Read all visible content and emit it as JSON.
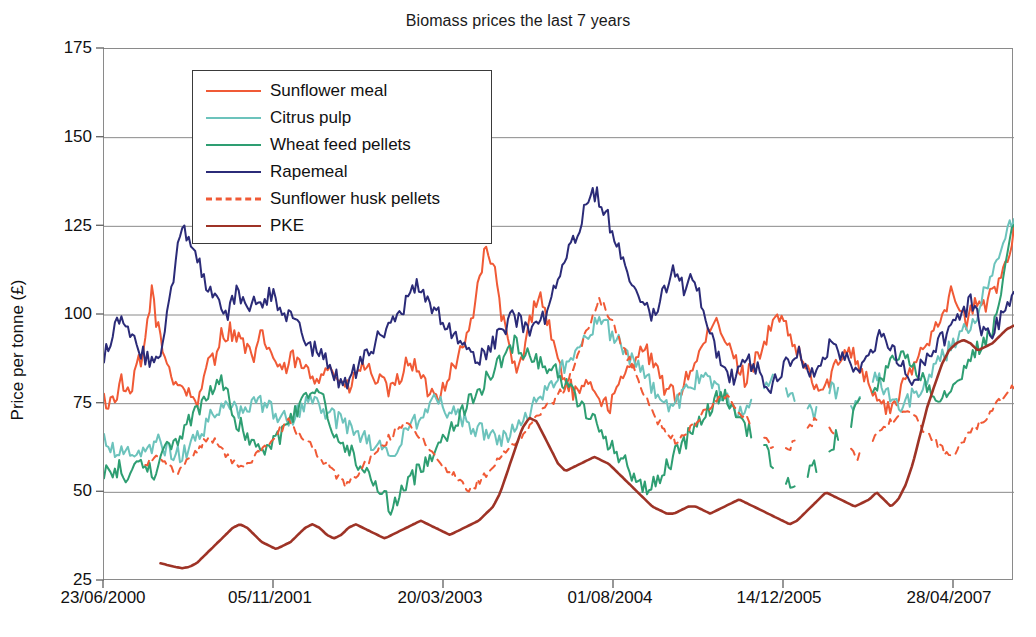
{
  "chart_data": {
    "type": "line",
    "title": "Biomass prices the last 7 years",
    "xlabel": "",
    "ylabel": "Price per tonne (£)",
    "ylim": [
      25,
      175
    ],
    "yticks": [
      25,
      50,
      75,
      100,
      125,
      150,
      175
    ],
    "ytick_labels": [
      "25",
      "50",
      "75",
      "100",
      "125",
      "150",
      "175"
    ],
    "xtick_labels": [
      "23/06/2000",
      "05/11/2001",
      "20/03/2003",
      "01/08/2004",
      "14/12/2005",
      "28/04/2007"
    ],
    "xlim_labels": [
      "23/06/2000",
      "28/04/2007"
    ],
    "grid": "horizontal",
    "legend_position": "upper-left-inside",
    "series": [
      {
        "name": "Sunflower meal",
        "color": "#F05A36",
        "style": "solid",
        "values": [
          76,
          75,
          76,
          77,
          79,
          82,
          78,
          76,
          80,
          88,
          84,
          92,
          100,
          107,
          100,
          94,
          90,
          87,
          84,
          82,
          81,
          80,
          79,
          78,
          77,
          76,
          76,
          80,
          86,
          90,
          88,
          92,
          95,
          94,
          96,
          95,
          94,
          93,
          92,
          90,
          88,
          87,
          92,
          95,
          92,
          90,
          88,
          86,
          85,
          84,
          86,
          88,
          87,
          86,
          85,
          84,
          83,
          82,
          83,
          84,
          86,
          85,
          84,
          83,
          82,
          80,
          79,
          80,
          82,
          84,
          86,
          85,
          84,
          83,
          82,
          81,
          80,
          79,
          78,
          80,
          82,
          84,
          86,
          88,
          86,
          84,
          82,
          80,
          79,
          78,
          77,
          78,
          80,
          82,
          84,
          86,
          88,
          90,
          92,
          95,
          100,
          106,
          112,
          116,
          118,
          116,
          112,
          106,
          100,
          95,
          90,
          86,
          84,
          86,
          90,
          95,
          100,
          104,
          106,
          104,
          100,
          96,
          92,
          88,
          85,
          82,
          80,
          79,
          78,
          77,
          78,
          80,
          82,
          80,
          78,
          76,
          75,
          74,
          76,
          78,
          80,
          82,
          84,
          86,
          88,
          90,
          92,
          90,
          88,
          86,
          84,
          82,
          80,
          79,
          78,
          77,
          78,
          80,
          82,
          84,
          86,
          88,
          90,
          92,
          94,
          96,
          98,
          96,
          94,
          92,
          90,
          88,
          86,
          84,
          82,
          84,
          86,
          88,
          90,
          92,
          94,
          96,
          98,
          100,
          98,
          96,
          94,
          92,
          90,
          88,
          86,
          84,
          82,
          80,
          79,
          78,
          80,
          82,
          84,
          86,
          88,
          90,
          92,
          90,
          88,
          86,
          84,
          82,
          80,
          78,
          76,
          75,
          74,
          73,
          74,
          76,
          78,
          80,
          82,
          84,
          86,
          88,
          90,
          92,
          94,
          96,
          98,
          100,
          102,
          104,
          106,
          104,
          102,
          100,
          98,
          100,
          102,
          104,
          103,
          102,
          104,
          106,
          108,
          110,
          112,
          116,
          120,
          124
        ],
        "note": "Orange-red solid line, continuous across full range"
      },
      {
        "name": "Citrus pulp",
        "color": "#6CC3BC",
        "style": "solid",
        "values": [
          64,
          63,
          62,
          63,
          62,
          61,
          60,
          61,
          62,
          63,
          64,
          63,
          62,
          61,
          60,
          62,
          64,
          66,
          68,
          70,
          72,
          74,
          76,
          75,
          74,
          73,
          72,
          74,
          76,
          75,
          74,
          73,
          72,
          71,
          70,
          72,
          74,
          76,
          75,
          74,
          73,
          72,
          71,
          70,
          69,
          68,
          67,
          66,
          65,
          64,
          63,
          62,
          61,
          62,
          64,
          66,
          68,
          70,
          72,
          74,
          76,
          75,
          74,
          73,
          72,
          71,
          70,
          69,
          68,
          67,
          66,
          65,
          64,
          65,
          66,
          68,
          70,
          72,
          74,
          76,
          78,
          80,
          82,
          84,
          86,
          88,
          90,
          92,
          94,
          96,
          98,
          97,
          96,
          94,
          92,
          90,
          88,
          86,
          84,
          82,
          80,
          78,
          76,
          75,
          74,
          76,
          78,
          80,
          82,
          84,
          82,
          80,
          78,
          76,
          75,
          74,
          73,
          72,
          74,
          76,
          78,
          80,
          82,
          80,
          78,
          76,
          75,
          74,
          73,
          72,
          74,
          76,
          78,
          80,
          78,
          76,
          75,
          74,
          76,
          78,
          80,
          82,
          80,
          78,
          76,
          75,
          74,
          76,
          78,
          80,
          82,
          84,
          86,
          88,
          90,
          92,
          94,
          96,
          98,
          100,
          104,
          108,
          112,
          116,
          120,
          124,
          127
        ],
        "gaps": true,
        "note": "Pale teal, sparse/gapped in 2005-2006, rises steeply to ~127 at far right"
      },
      {
        "name": "Wheat feed pellets",
        "color": "#2E9E72",
        "style": "solid",
        "values": [
          56,
          58,
          55,
          57,
          54,
          56,
          58,
          60,
          57,
          55,
          58,
          60,
          62,
          64,
          66,
          68,
          70,
          72,
          74,
          76,
          78,
          80,
          82,
          78,
          74,
          70,
          68,
          66,
          64,
          62,
          60,
          62,
          64,
          66,
          68,
          70,
          72,
          74,
          76,
          78,
          80,
          76,
          72,
          68,
          66,
          64,
          62,
          60,
          58,
          56,
          54,
          52,
          50,
          48,
          46,
          48,
          50,
          52,
          54,
          56,
          58,
          60,
          62,
          64,
          66,
          68,
          70,
          72,
          74,
          76,
          78,
          80,
          82,
          84,
          86,
          88,
          90,
          92,
          91,
          90,
          89,
          88,
          87,
          86,
          85,
          84,
          82,
          80,
          78,
          76,
          74,
          72,
          70,
          68,
          66,
          64,
          62,
          60,
          58,
          56,
          54,
          52,
          50,
          52,
          54,
          56,
          58,
          60,
          62,
          64,
          66,
          68,
          70,
          72,
          74,
          76,
          78,
          76,
          74,
          72,
          70,
          68,
          66,
          64,
          62,
          60,
          58,
          56,
          54,
          52,
          50,
          52,
          54,
          56,
          58,
          60,
          62,
          64,
          66,
          68,
          70,
          72,
          74,
          76,
          78,
          80,
          82,
          84,
          86,
          88,
          90,
          88,
          86,
          84,
          82,
          80,
          78,
          76,
          78,
          80,
          82,
          84,
          86,
          88,
          90,
          92,
          94,
          96,
          100,
          110,
          120,
          127
        ],
        "gaps": true,
        "note": "Sea-green, very volatile early, long data gaps in 2005-2006, dips to ~60 near 2007 then spikes to ~127"
      },
      {
        "name": "Rapemeal",
        "color": "#2B2B78",
        "style": "solid",
        "values": [
          88,
          92,
          96,
          100,
          98,
          96,
          94,
          90,
          88,
          86,
          88,
          92,
          100,
          110,
          120,
          125,
          122,
          118,
          114,
          110,
          106,
          104,
          102,
          100,
          104,
          106,
          105,
          104,
          103,
          102,
          104,
          106,
          105,
          103,
          101,
          99,
          97,
          95,
          93,
          91,
          90,
          88,
          86,
          84,
          82,
          80,
          82,
          84,
          86,
          88,
          90,
          92,
          94,
          96,
          98,
          100,
          102,
          104,
          106,
          108,
          106,
          104,
          102,
          100,
          98,
          96,
          94,
          92,
          90,
          88,
          86,
          88,
          90,
          92,
          94,
          96,
          98,
          100,
          98,
          96,
          94,
          96,
          98,
          100,
          104,
          108,
          112,
          116,
          120,
          124,
          128,
          132,
          135,
          133,
          130,
          126,
          122,
          118,
          114,
          110,
          106,
          104,
          102,
          100,
          102,
          106,
          110,
          112,
          110,
          108,
          112,
          110,
          106,
          100,
          94,
          90,
          86,
          84,
          82,
          84,
          86,
          88,
          86,
          84,
          82,
          80,
          82,
          84,
          86,
          88,
          90,
          88,
          86,
          84,
          86,
          88,
          90,
          92,
          90,
          88,
          86,
          84,
          86,
          88,
          90,
          92,
          94,
          92,
          90,
          88,
          86,
          84,
          82,
          84,
          86,
          88,
          90,
          92,
          94,
          96,
          98,
          100,
          102,
          104,
          100,
          96,
          94,
          96,
          98,
          100,
          102,
          104
        ],
        "note": "Dark navy blue; highest peak ~135 mid-2003/2004"
      },
      {
        "name": "Sunflower husk pellets",
        "color": "#F05A36",
        "style": "dashed",
        "values": [
          58,
          59,
          60,
          58,
          57,
          56,
          58,
          60,
          62,
          64,
          66,
          64,
          62,
          60,
          58,
          56,
          58,
          60,
          62,
          64,
          66,
          68,
          70,
          68,
          66,
          64,
          62,
          60,
          58,
          56,
          54,
          52,
          54,
          56,
          58,
          60,
          62,
          64,
          66,
          68,
          70,
          68,
          66,
          64,
          62,
          60,
          58,
          56,
          54,
          52,
          50,
          52,
          54,
          56,
          58,
          60,
          62,
          64,
          66,
          68,
          70,
          72,
          74,
          76,
          78,
          80,
          85,
          90,
          95,
          100,
          104,
          102,
          98,
          94,
          90,
          86,
          82,
          78,
          74,
          70,
          68,
          66,
          64,
          66,
          68,
          70,
          72,
          74,
          76,
          78,
          76,
          74,
          72,
          70,
          68,
          66,
          64,
          62,
          60,
          62,
          64,
          66,
          68,
          70,
          72,
          70,
          68,
          66,
          64,
          62,
          60,
          62,
          64,
          66,
          68,
          70,
          72,
          74,
          72,
          70,
          68,
          66,
          64,
          62,
          60,
          62,
          64,
          66,
          68,
          70,
          72,
          74,
          76,
          78,
          80
        ],
        "gaps": true,
        "note": "Dashed orange-red; mostly between 50 and 80, peaks ~104 in 2003 spike"
      },
      {
        "name": "PKE",
        "color": "#9E3326",
        "style": "solid",
        "values": [
          30,
          29.5,
          29,
          28.6,
          29,
          30,
          32,
          34,
          36,
          38,
          40,
          41,
          40,
          38,
          36,
          35,
          34,
          35,
          36,
          38,
          40,
          41,
          40,
          38,
          37,
          38,
          40,
          41,
          40,
          39,
          38,
          37,
          38,
          39,
          40,
          41,
          42,
          41,
          40,
          39,
          38,
          39,
          40,
          41,
          42,
          44,
          46,
          50,
          56,
          62,
          68,
          71,
          70,
          66,
          62,
          58,
          56,
          57,
          58,
          59,
          60,
          59,
          58,
          56,
          54,
          52,
          50,
          48,
          46,
          45,
          44,
          44,
          45,
          46,
          46,
          45,
          44,
          45,
          46,
          47,
          48,
          47,
          46,
          45,
          44,
          43,
          42,
          41,
          42,
          44,
          46,
          48,
          50,
          49,
          48,
          47,
          46,
          47,
          48,
          50,
          48,
          46,
          48,
          52,
          58,
          66,
          74,
          80,
          86,
          90,
          92,
          93,
          92,
          90,
          91,
          92,
          94,
          96,
          97
        ],
        "note": "Dark brick red, smooth; starts ~30 at around late 2000, lowest series until 2006, rises steeply to ~97 by 2007"
      }
    ],
    "annotations": []
  },
  "legend": {
    "items": [
      {
        "label": "Sunflower meal",
        "color": "#F05A36",
        "style": "solid"
      },
      {
        "label": "Citrus pulp",
        "color": "#6CC3BC",
        "style": "solid"
      },
      {
        "label": "Wheat feed pellets",
        "color": "#2E9E72",
        "style": "solid"
      },
      {
        "label": "Rapemeal",
        "color": "#2B2B78",
        "style": "solid"
      },
      {
        "label": "Sunflower husk pellets",
        "color": "#F05A36",
        "style": "dashed"
      },
      {
        "label": "PKE",
        "color": "#9E3326",
        "style": "solid"
      }
    ]
  },
  "axis": {
    "y_title": "Price per tonne (£)",
    "y_labels": [
      "175",
      "150",
      "125",
      "100",
      "75",
      "50",
      "25"
    ],
    "x_labels": [
      "23/06/2000",
      "05/11/2001",
      "20/03/2003",
      "01/08/2004",
      "14/12/2005",
      "28/04/2007"
    ]
  },
  "bottom_caption": {
    "text": ""
  }
}
